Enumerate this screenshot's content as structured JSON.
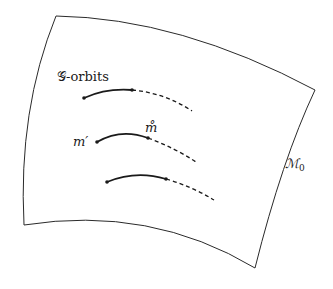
{
  "diagram": {
    "labels": {
      "orbits": "𝒢-orbits",
      "m_prime": "m′",
      "m_ring": "m̊",
      "manifold": "ℳ",
      "manifold_sub": "0"
    },
    "colors": {
      "stroke": "#2a2a2a",
      "background": "#ffffff"
    },
    "manifold_corners": {
      "top_left": [
        56,
        16
      ],
      "top_right": [
        315,
        90
      ],
      "bottom_right": [
        255,
        268
      ],
      "bottom_left": [
        24,
        225
      ]
    },
    "orbits": [
      {
        "start": [
          84,
          98
        ],
        "mid": [
          132,
          90
        ],
        "end": [
          192,
          111
        ]
      },
      {
        "start": [
          97,
          142
        ],
        "mid": [
          148,
          138
        ],
        "end": [
          196,
          162
        ]
      },
      {
        "start": [
          107,
          182
        ],
        "mid": [
          166,
          179
        ],
        "end": [
          214,
          200
        ]
      }
    ]
  }
}
